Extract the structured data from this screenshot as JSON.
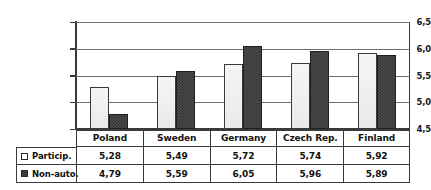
{
  "chart_data": {
    "type": "bar",
    "title": "",
    "xlabel": "",
    "ylabel": "",
    "categories": [
      "Poland",
      "Sweden",
      "Germany",
      "Czech Rep.",
      "Finland"
    ],
    "series": [
      {
        "name": "Particip.",
        "values": [
          5.28,
          4.99,
          5.72,
          5.74,
          5.92
        ],
        "display_values": [
          "5,28",
          "5,49",
          "5,72",
          "5,74",
          "5,92"
        ],
        "marker": "open-square",
        "color": "#e9e9e9"
      },
      {
        "name": "Non-auto.",
        "values": [
          4.79,
          5.59,
          6.05,
          5.96,
          5.89
        ],
        "display_values": [
          "4,79",
          "5,59",
          "6,05",
          "5,96",
          "5,89"
        ],
        "marker": "hatched-square",
        "color": "#4e4e4e"
      }
    ],
    "ylim": [
      4.5,
      6.5
    ],
    "ytick_values": [
      6.5,
      6.0,
      5.5,
      5.0,
      4.5
    ],
    "ytick_labels": [
      "6,5",
      "6,0",
      "5,5",
      "5,0",
      "4,5"
    ],
    "grid": true,
    "legend_position": "table-left-column",
    "decimal_separator": ","
  },
  "series_values": {
    "particip": [
      "5,28",
      "5,49",
      "5,72",
      "5,74",
      "5,92"
    ],
    "nonauto": [
      "4,79",
      "5,59",
      "6,05",
      "5,96",
      "5,89"
    ]
  },
  "plot_values": {
    "particip": [
      5.28,
      5.49,
      5.72,
      5.74,
      5.92
    ],
    "nonauto": [
      4.79,
      5.59,
      6.05,
      5.96,
      5.89
    ]
  },
  "legend": {
    "row0_label": "Particip.",
    "row1_label": "Non-auto.",
    "row0_marker": "open-square-icon",
    "row1_marker": "hatched-square-icon"
  },
  "axis": {
    "ticks": [
      "6,5",
      "6,0",
      "5,5",
      "5,0",
      "4,5"
    ]
  },
  "table": {
    "headers": [
      "Poland",
      "Sweden",
      "Germany",
      "Czech Rep.",
      "Finland"
    ]
  },
  "colors": {
    "series_particip": "#e9e9e9",
    "series_nonauto": "#4e4e4e",
    "frame": "#3a3a3a",
    "gridline": "#6d6d6d",
    "background": "#ffffff"
  }
}
